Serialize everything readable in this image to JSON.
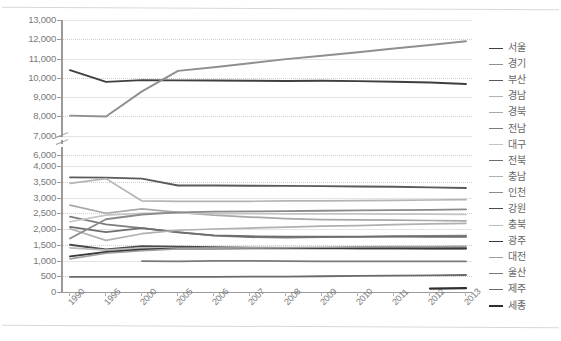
{
  "chart_data": {
    "type": "line",
    "title": "",
    "xlabel": "",
    "ylabel": "",
    "legend_position": "right",
    "grid": true,
    "axis_break": true,
    "categories": [
      "1990",
      "1995",
      "2000",
      "2005",
      "2006",
      "2007",
      "2008",
      "2009",
      "2010",
      "2011",
      "2012",
      "2013"
    ],
    "y_ticks_lower": [
      "0",
      "500",
      "1,000",
      "1,500",
      "2,000",
      "2,500",
      "3,000",
      "3,500",
      "4,000"
    ],
    "y_ticks_upper": [
      "6,000",
      "7,000",
      "8,000",
      "9,000",
      "10,000",
      "11,000",
      "12,000",
      "13,000"
    ],
    "ylim_lower": [
      0,
      4000
    ],
    "ylim_upper": [
      6000,
      13000
    ],
    "series": [
      {
        "name": "서울",
        "color": "#3f3f3f",
        "width": 1.9,
        "values": [
          10400,
          9790,
          9880,
          9870,
          9860,
          9850,
          9840,
          9850,
          9830,
          9800,
          9760,
          9680
        ]
      },
      {
        "name": "경기",
        "color": "#8f8f8f",
        "width": 1.9,
        "values": [
          5600,
          8000,
          9300,
          10360,
          10550,
          10760,
          10970,
          11150,
          11330,
          11520,
          11700,
          11900
        ]
      },
      {
        "name": "부산",
        "color": "#5a5a5a",
        "width": 1.9,
        "values": [
          3640,
          3630,
          3600,
          3380,
          3380,
          3375,
          3370,
          3360,
          3350,
          3340,
          3320,
          3300
        ]
      },
      {
        "name": "경남",
        "color": "#b4b4b4",
        "width": 1.7,
        "values": [
          3450,
          3600,
          2890,
          2880,
          2880,
          2880,
          2890,
          2890,
          2900,
          2910,
          2920,
          2930
        ]
      },
      {
        "name": "경북",
        "color": "#a8a8a8",
        "width": 1.7,
        "values": [
          2760,
          2500,
          2640,
          2530,
          2440,
          2380,
          2330,
          2300,
          2290,
          2280,
          2270,
          2260
        ]
      },
      {
        "name": "전남",
        "color": "#7d7d7d",
        "width": 1.8,
        "values": [
          2390,
          2150,
          2030,
          1900,
          1790,
          1740,
          1730,
          1740,
          1750,
          1770,
          1780,
          1790
        ]
      },
      {
        "name": "대구",
        "color": "#c4c4c4",
        "width": 1.7,
        "values": [
          2230,
          2440,
          2500,
          2510,
          2490,
          2490,
          2480,
          2480,
          2480,
          2470,
          2470,
          2460
        ]
      },
      {
        "name": "전북",
        "color": "#6e6e6e",
        "width": 1.8,
        "values": [
          2070,
          1900,
          2030,
          1890,
          1800,
          1770,
          1760,
          1760,
          1760,
          1760,
          1750,
          1750
        ]
      },
      {
        "name": "충남",
        "color": "#b0b0b0",
        "width": 1.7,
        "values": [
          2010,
          1640,
          1850,
          1960,
          2000,
          2030,
          2060,
          2090,
          2110,
          2140,
          2160,
          2180
        ]
      },
      {
        "name": "인천",
        "color": "#8a8a8a",
        "width": 1.8,
        "values": [
          1700,
          2310,
          2460,
          2530,
          2550,
          2560,
          2570,
          2580,
          2590,
          2600,
          2610,
          2620
        ]
      },
      {
        "name": "강원",
        "color": "#4a4a4a",
        "width": 1.9,
        "values": [
          1500,
          1350,
          1450,
          1440,
          1420,
          1410,
          1400,
          1400,
          1390,
          1390,
          1380,
          1380
        ]
      },
      {
        "name": "충북",
        "color": "#bcbcbc",
        "width": 1.7,
        "values": [
          1400,
          1330,
          1400,
          1400,
          1400,
          1400,
          1400,
          1400,
          1400,
          1400,
          1390,
          1390
        ]
      },
      {
        "name": "광주",
        "color": "#3a3a3a",
        "width": 1.9,
        "values": [
          1130,
          1270,
          1350,
          1380,
          1380,
          1390,
          1390,
          1390,
          1390,
          1390,
          1390,
          1390
        ]
      },
      {
        "name": "대전",
        "color": "#9e9e9e",
        "width": 1.7,
        "values": [
          1050,
          1230,
          1310,
          1370,
          1390,
          1400,
          1410,
          1420,
          1430,
          1440,
          1440,
          1450
        ]
      },
      {
        "name": "울산",
        "color": "#7a7a7a",
        "width": 1.8,
        "values": [
          null,
          null,
          980,
          970,
          990,
          990,
          980,
          970,
          970,
          970,
          970,
          970
        ]
      },
      {
        "name": "제주",
        "color": "#6a6a6a",
        "width": 1.8,
        "values": [
          480,
          480,
          480,
          480,
          480,
          490,
          490,
          500,
          510,
          520,
          530,
          540
        ]
      },
      {
        "name": "세종",
        "color": "#2f2f2f",
        "width": 2.2,
        "values": [
          null,
          null,
          null,
          null,
          null,
          null,
          null,
          null,
          null,
          null,
          110,
          120
        ]
      }
    ]
  },
  "legend": {
    "items": [
      {
        "label": "서울"
      },
      {
        "label": "경기"
      },
      {
        "label": "부산"
      },
      {
        "label": "경남"
      },
      {
        "label": "경북"
      },
      {
        "label": "전남"
      },
      {
        "label": "대구"
      },
      {
        "label": "전북"
      },
      {
        "label": "충남"
      },
      {
        "label": "인천"
      },
      {
        "label": "강원"
      },
      {
        "label": "충북"
      },
      {
        "label": "광주"
      },
      {
        "label": "대전"
      },
      {
        "label": "울산"
      },
      {
        "label": "제주"
      },
      {
        "label": "세종"
      }
    ]
  },
  "colors": {
    "axis": "#9a9a9a",
    "gridline": "#e4e4e4",
    "text": "#7a7a7a",
    "background": "#ffffff",
    "border": "#d8d8d8"
  }
}
